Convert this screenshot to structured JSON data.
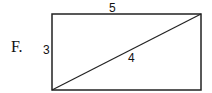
{
  "option_label": "F.",
  "figure": {
    "shape": "rectangle-with-diagonal",
    "labels": {
      "top": "5",
      "left": "3",
      "diagonal": "4"
    }
  }
}
